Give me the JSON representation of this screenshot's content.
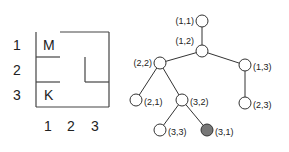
{
  "maze": {
    "row_labels": [
      "1",
      "2",
      "3"
    ],
    "col_labels": [
      "1",
      "2",
      "3"
    ],
    "cells": {
      "M": "M",
      "K": "K"
    }
  },
  "tree": {
    "nodes": [
      {
        "id": "n11",
        "label": "(1,1)",
        "x": 202,
        "y": 21,
        "label_side": "left",
        "filled": false
      },
      {
        "id": "n12",
        "label": "(1,2)",
        "x": 202,
        "y": 51,
        "label_side": "left-up",
        "filled": false
      },
      {
        "id": "n22",
        "label": "(2,2)",
        "x": 160,
        "y": 63,
        "label_side": "left",
        "filled": false
      },
      {
        "id": "n13",
        "label": "(1,3)",
        "x": 245,
        "y": 65,
        "label_side": "right",
        "filled": false
      },
      {
        "id": "n21",
        "label": "(2,1)",
        "x": 136,
        "y": 100,
        "label_side": "right",
        "filled": false
      },
      {
        "id": "n32",
        "label": "(3,2)",
        "x": 182,
        "y": 100,
        "label_side": "right",
        "filled": false
      },
      {
        "id": "n23",
        "label": "(2,3)",
        "x": 245,
        "y": 103,
        "label_side": "right",
        "filled": false
      },
      {
        "id": "n33",
        "label": "(3,3)",
        "x": 160,
        "y": 130,
        "label_side": "right",
        "filled": false
      },
      {
        "id": "n31",
        "label": "(3,1)",
        "x": 207,
        "y": 130,
        "label_side": "right",
        "filled": true
      }
    ],
    "edges": [
      [
        "n11",
        "n12"
      ],
      [
        "n12",
        "n22"
      ],
      [
        "n12",
        "n13"
      ],
      [
        "n22",
        "n21"
      ],
      [
        "n22",
        "n32"
      ],
      [
        "n13",
        "n23"
      ],
      [
        "n32",
        "n33"
      ],
      [
        "n32",
        "n31"
      ]
    ],
    "colors": {
      "line": "#333333",
      "node_fill": "#ffffff",
      "goal_fill": "#777777"
    }
  }
}
